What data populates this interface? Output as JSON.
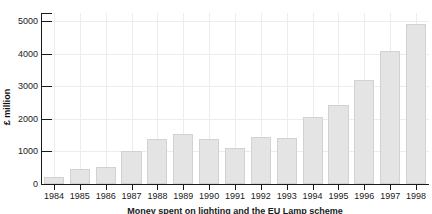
{
  "chart_data": {
    "type": "bar",
    "title": "",
    "xlabel": "",
    "ylabel": "£ million",
    "categories": [
      "1984",
      "1985",
      "1986",
      "1987",
      "1988",
      "1989",
      "1990",
      "1991",
      "1992",
      "1993",
      "1994",
      "1995",
      "1996",
      "1997",
      "1998"
    ],
    "values": [
      210,
      470,
      530,
      1000,
      1390,
      1530,
      1390,
      1090,
      1440,
      1420,
      2060,
      2440,
      3180,
      4090,
      4910
    ],
    "ylim": [
      0,
      5250
    ],
    "yticks": [
      0,
      1000,
      2000,
      3000,
      4000,
      5000
    ],
    "ytick_labels": [
      "0",
      "1000",
      "2000",
      "3000",
      "4000",
      "5000"
    ],
    "grid": true,
    "grid_axis": "both",
    "legend": "none",
    "bar_color": "#e4e4e4",
    "bar_edge_color": "#d2d2d2",
    "grid_color": "#ececec",
    "axis_color": "#1a1a1a"
  },
  "caption": {
    "text": "Money spent on lighting and the EU Lamp scheme"
  }
}
